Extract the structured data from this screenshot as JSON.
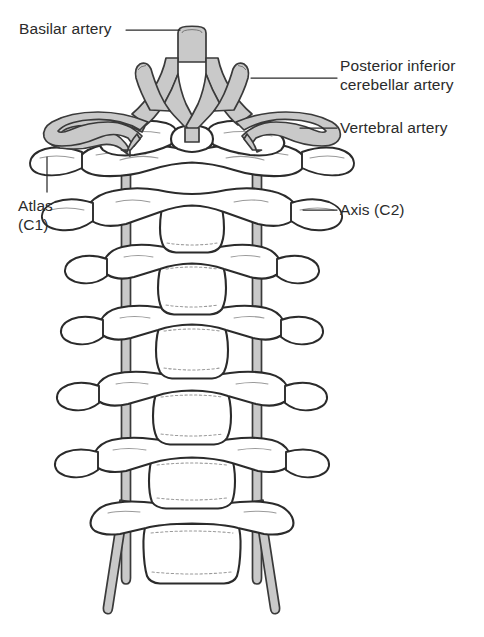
{
  "figure": {
    "type": "anatomical-line-diagram",
    "view": "posterior",
    "background_color": "#ffffff",
    "ink_color": "#2b2b2b",
    "artery_fill_color": "#c9c9c9",
    "artery_outline_color": "#3a3a3a",
    "bone_outline_color": "#2b2b2b",
    "bone_fill_color": "#ffffff",
    "detail_line_color": "#8c8c8c"
  },
  "labels": {
    "basilar_artery": "Basilar artery",
    "pica_line1": "Posterior inferior",
    "pica_line2": "cerebellar artery",
    "vertebral_artery": "Vertebral artery",
    "atlas_line1": "Atlas",
    "atlas_line2": "(C1)",
    "axis": "Axis (C2)"
  },
  "structures": {
    "vertebrae": [
      {
        "name": "Atlas (C1)",
        "level": "C1"
      },
      {
        "name": "Axis (C2)",
        "level": "C2"
      },
      {
        "name": "Third cervical vertebra",
        "level": "C3"
      },
      {
        "name": "Fourth cervical vertebra",
        "level": "C4"
      },
      {
        "name": "Fifth cervical vertebra",
        "level": "C5"
      },
      {
        "name": "Sixth cervical vertebra",
        "level": "C6"
      },
      {
        "name": "Seventh cervical vertebra",
        "level": "C7"
      }
    ],
    "arteries": [
      {
        "name": "Basilar artery",
        "side": "midline"
      },
      {
        "name": "Posterior inferior cerebellar artery",
        "side": "left"
      },
      {
        "name": "Posterior inferior cerebellar artery",
        "side": "right"
      },
      {
        "name": "Vertebral artery",
        "side": "left"
      },
      {
        "name": "Vertebral artery",
        "side": "right"
      }
    ]
  }
}
